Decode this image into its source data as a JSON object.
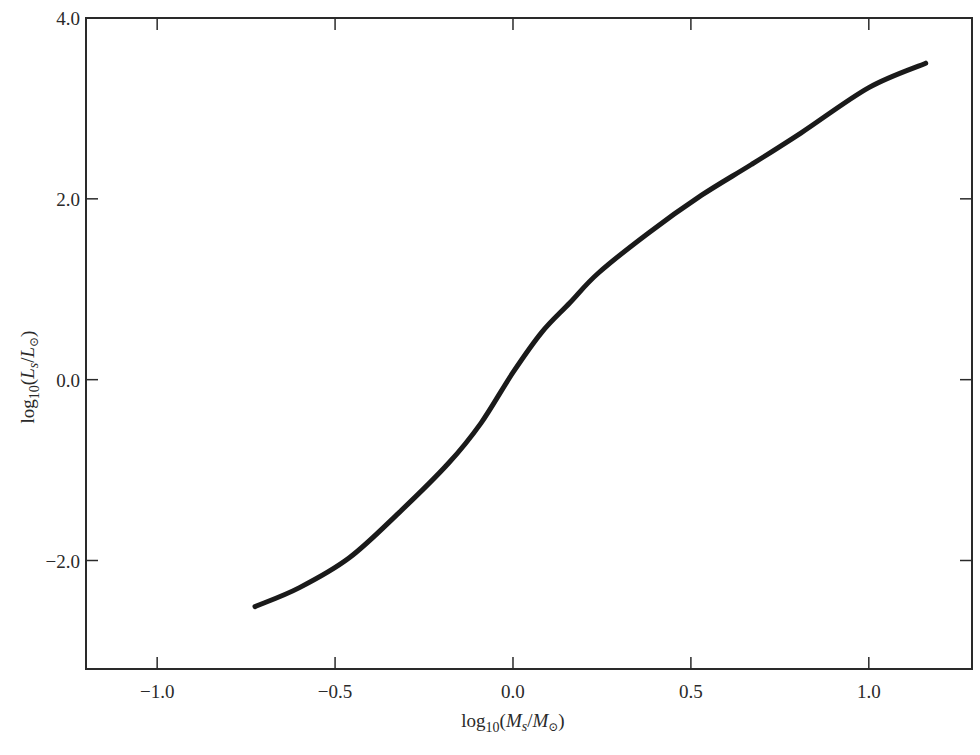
{
  "chart_data": {
    "type": "line",
    "title": "",
    "xlabel": "log10(Ms/M☉)",
    "ylabel": "log10(Ls/L☉)",
    "xlim": [
      -1.2,
      1.29
    ],
    "ylim": [
      -3.2,
      4.0
    ],
    "grid": false,
    "legend": null,
    "x_ticks": [
      -1.0,
      -0.5,
      0.0,
      0.5,
      1.0
    ],
    "x_tick_labels": [
      "−1.0",
      "−0.5",
      "0.0",
      "0.5",
      "1.0"
    ],
    "y_ticks": [
      4.0,
      2.0,
      0.0,
      -2.0
    ],
    "y_tick_labels": [
      "4.0",
      "2.0",
      "0.0",
      "−2.0"
    ],
    "series": [
      {
        "name": "mass-luminosity relation",
        "color": "#1a1a1a",
        "x": [
          -0.725,
          -0.6,
          -0.46,
          -0.32,
          -0.18,
          -0.09,
          0.0,
          0.08,
          0.16,
          0.24,
          0.38,
          0.53,
          0.67,
          0.81,
          1.0,
          1.16
        ],
        "y": [
          -2.51,
          -2.3,
          -1.97,
          -1.47,
          -0.92,
          -0.48,
          0.08,
          0.52,
          0.85,
          1.18,
          1.62,
          2.04,
          2.38,
          2.73,
          3.23,
          3.5
        ]
      }
    ]
  },
  "labels": {
    "x_axis": {
      "prefix": "log",
      "sub": "10",
      "open": "(",
      "M1": "M",
      "s1": "s",
      "slash": "/",
      "M2": "M",
      "sun": "⊙",
      "close": ")"
    },
    "y_axis": {
      "prefix": "log",
      "sub": "10",
      "open": "(",
      "L1": "L",
      "s1": "s",
      "slash": "/",
      "L2": "L",
      "sun": "⊙",
      "close": ")"
    }
  }
}
